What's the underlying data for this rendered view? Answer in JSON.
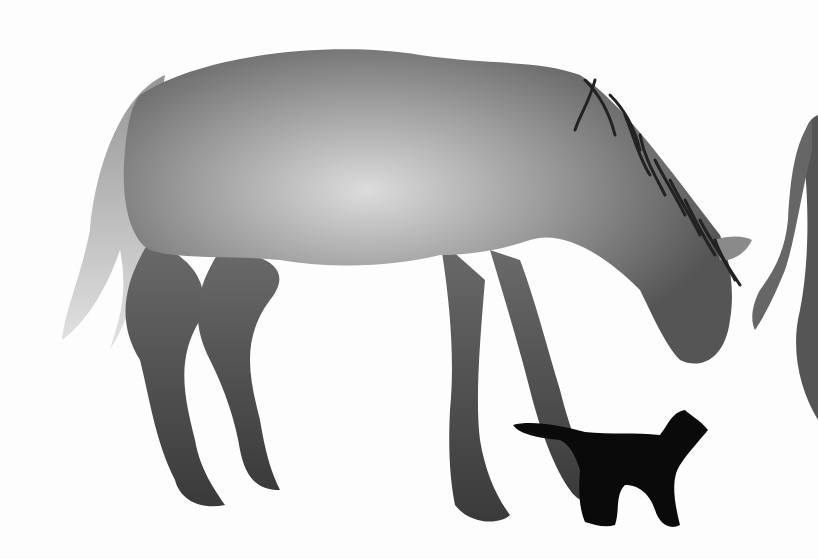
{
  "scene": {
    "description": "Watercolor illustration of a grey horse bending its head down toward a small black cat; a second horse partially visible at the right edge",
    "background_color": "#fdfdfd",
    "subjects": [
      {
        "name": "horse",
        "color": "#7a7a7a",
        "highlight": "#d8d8d8"
      },
      {
        "name": "cat",
        "color": "#0a0a0a"
      },
      {
        "name": "second-horse-partial",
        "color": "#555555"
      }
    ]
  }
}
